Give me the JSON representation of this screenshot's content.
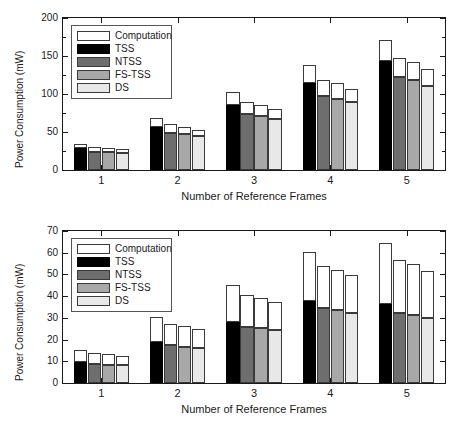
{
  "figure": {
    "panels": [
      {
        "id": "top",
        "ylabel": "Power Consumption (mW)",
        "xlabel": "Number of Reference Frames",
        "yticks": [
          "0",
          "50",
          "100",
          "150",
          "200"
        ],
        "xticklabels": [
          "1",
          "2",
          "3",
          "4",
          "5"
        ],
        "legend": [
          {
            "key": "comp",
            "label": "Computation"
          },
          {
            "key": "tss",
            "label": "TSS"
          },
          {
            "key": "ntss",
            "label": "NTSS"
          },
          {
            "key": "fstss",
            "label": "FS-TSS"
          },
          {
            "key": "ds",
            "label": "DS"
          }
        ]
      },
      {
        "id": "bottom",
        "ylabel": "Power Consumption (mW)",
        "xlabel": "Number of Reference Frames",
        "yticks": [
          "0",
          "10",
          "20",
          "30",
          "40",
          "50",
          "60",
          "70"
        ],
        "xticklabels": [
          "1",
          "2",
          "3",
          "4",
          "5"
        ],
        "legend": [
          {
            "key": "comp",
            "label": "Computation"
          },
          {
            "key": "tss",
            "label": "TSS"
          },
          {
            "key": "ntss",
            "label": "NTSS"
          },
          {
            "key": "fstss",
            "label": "FS-TSS"
          },
          {
            "key": "ds",
            "label": "DS"
          }
        ]
      }
    ]
  },
  "colors": {
    "computation": "#ffffff",
    "tss": "#000000",
    "ntss": "#6e6e6e",
    "fstss": "#a8a8a8",
    "ds": "#e8e8e8",
    "axis": "#1a1a1a"
  },
  "chart_data": [
    {
      "type": "bar",
      "id": "top-panel",
      "stacked": true,
      "title": "",
      "xlabel": "Number of Reference Frames",
      "ylabel": "Power Consumption (mW)",
      "ylim": [
        0,
        200
      ],
      "ytick_step": 50,
      "grid": false,
      "legend_position": "upper left",
      "categories": [
        "1",
        "2",
        "3",
        "4",
        "5"
      ],
      "methods": [
        "TSS",
        "NTSS",
        "FS-TSS",
        "DS"
      ],
      "stack_labels": [
        "Memory",
        "Computation"
      ],
      "series": [
        {
          "name": "TSS",
          "memory": [
            29,
            57,
            86,
            115,
            144
          ],
          "total": [
            34,
            68,
            102,
            138,
            171
          ]
        },
        {
          "name": "NTSS",
          "memory": [
            24,
            49,
            74,
            98,
            123
          ],
          "total": [
            30,
            61,
            89,
            118,
            148
          ]
        },
        {
          "name": "FS-TSS",
          "memory": [
            24,
            48,
            71,
            94,
            118
          ],
          "total": [
            29,
            56,
            85,
            114,
            142
          ]
        },
        {
          "name": "DS",
          "memory": [
            22,
            45,
            67,
            89,
            111
          ],
          "total": [
            27,
            53,
            80,
            106,
            133
          ]
        }
      ]
    },
    {
      "type": "bar",
      "id": "bottom-panel",
      "stacked": true,
      "title": "",
      "xlabel": "Number of Reference Frames",
      "ylabel": "Power Consumption (mW)",
      "ylim": [
        0,
        70
      ],
      "ytick_step": 10,
      "grid": false,
      "legend_position": "upper left",
      "categories": [
        "1",
        "2",
        "3",
        "4",
        "5"
      ],
      "methods": [
        "TSS",
        "NTSS",
        "FS-TSS",
        "DS"
      ],
      "stack_labels": [
        "Memory",
        "Computation"
      ],
      "series": [
        {
          "name": "TSS",
          "memory": [
            9.5,
            19.0,
            28.3,
            37.7,
            36.5
          ],
          "total": [
            15.1,
            30.2,
            45.3,
            60.3,
            64.6
          ]
        },
        {
          "name": "NTSS",
          "memory": [
            8.7,
            17.3,
            25.9,
            34.4,
            32.4
          ],
          "total": [
            13.6,
            27.0,
            40.4,
            53.8,
            56.8
          ]
        },
        {
          "name": "FS-TSS",
          "memory": [
            8.4,
            16.7,
            25.2,
            33.5,
            31.3
          ],
          "total": [
            13.2,
            26.1,
            39.1,
            52.1,
            54.6
          ]
        },
        {
          "name": "DS",
          "memory": [
            8.1,
            16.1,
            24.2,
            32.2,
            29.8
          ],
          "total": [
            12.5,
            24.9,
            37.3,
            49.7,
            51.7
          ]
        }
      ]
    }
  ]
}
